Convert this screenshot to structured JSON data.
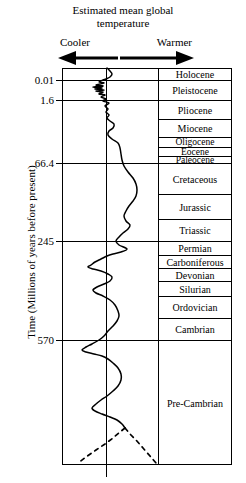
{
  "header": {
    "title_line1": "Estimated mean global",
    "title_line2": "temperature",
    "cooler_label": "Cooler",
    "warmer_label": "Warmer"
  },
  "axis": {
    "y_title": "Time (Millions of years before present)"
  },
  "chart_data": {
    "type": "line",
    "title": "Estimated mean global temperature",
    "xlabel": "Estimated mean global temperature",
    "ylabel": "Time (Millions of years before present)",
    "x_direction_left": "Cooler",
    "x_direction_right": "Warmer",
    "y_axis_inverted": true,
    "y_scale": "non-linear (geological stages)",
    "grid": true,
    "legend": "none",
    "y_tick_labels": [
      "0.01",
      "1.6",
      "66.4",
      "245",
      "570"
    ],
    "y_tick_values": [
      0.01,
      1.6,
      66.4,
      245,
      570
    ],
    "y_tick_pixels": [
      80,
      100,
      163,
      241,
      340
    ],
    "geologic_units": [
      {
        "name": "Holocene",
        "y_top": 68,
        "y_bottom": 80
      },
      {
        "name": "Pleistocene",
        "y_top": 80,
        "y_bottom": 100
      },
      {
        "name": "Pliocene",
        "y_top": 100,
        "y_bottom": 119
      },
      {
        "name": "Miocene",
        "y_top": 119,
        "y_bottom": 137
      },
      {
        "name": "Oligocene",
        "y_top": 137,
        "y_bottom": 147
      },
      {
        "name": "Eocene",
        "y_top": 147,
        "y_bottom": 156
      },
      {
        "name": "Paleocene",
        "y_top": 156,
        "y_bottom": 163
      },
      {
        "name": "Cretaceous",
        "y_top": 163,
        "y_bottom": 194
      },
      {
        "name": "Jurassic",
        "y_top": 194,
        "y_bottom": 219
      },
      {
        "name": "Triassic",
        "y_top": 219,
        "y_bottom": 241
      },
      {
        "name": "Permian",
        "y_top": 241,
        "y_bottom": 255
      },
      {
        "name": "Carboniferous",
        "y_top": 255,
        "y_bottom": 268
      },
      {
        "name": "Devonian",
        "y_top": 268,
        "y_bottom": 281
      },
      {
        "name": "Silurian",
        "y_top": 281,
        "y_bottom": 296
      },
      {
        "name": "Ordovician",
        "y_top": 296,
        "y_bottom": 318
      },
      {
        "name": "Cambrian",
        "y_top": 318,
        "y_bottom": 340
      },
      {
        "name": "Pre-Cambrian",
        "y_top": 340,
        "y_bottom": 465
      }
    ],
    "series": [
      {
        "name": "Estimated mean global temperature",
        "style": "solid",
        "note": "relative temperature anomaly; centre vertical line = reference, right = warmer, left = cooler",
        "points_px": [
          [
            107,
            68
          ],
          [
            110,
            71
          ],
          [
            112,
            74
          ],
          [
            110,
            77
          ],
          [
            106,
            79
          ],
          [
            103,
            80
          ],
          [
            99,
            82
          ],
          [
            104,
            83
          ],
          [
            96,
            85
          ],
          [
            103,
            86
          ],
          [
            93,
            87
          ],
          [
            102,
            88
          ],
          [
            95,
            89
          ],
          [
            104,
            90
          ],
          [
            96,
            91
          ],
          [
            103,
            92
          ],
          [
            99,
            94
          ],
          [
            105,
            95
          ],
          [
            101,
            97
          ],
          [
            106,
            99
          ],
          [
            103,
            101
          ],
          [
            109,
            103
          ],
          [
            105,
            106
          ],
          [
            108,
            109
          ],
          [
            106,
            112
          ],
          [
            109,
            115
          ],
          [
            107,
            118
          ],
          [
            110,
            121
          ],
          [
            114,
            124
          ],
          [
            113,
            128
          ],
          [
            109,
            131
          ],
          [
            108,
            135
          ],
          [
            112,
            139
          ],
          [
            118,
            143
          ],
          [
            120,
            148
          ],
          [
            121,
            154
          ],
          [
            122,
            160
          ],
          [
            124,
            166
          ],
          [
            128,
            172
          ],
          [
            133,
            178
          ],
          [
            136,
            184
          ],
          [
            137,
            190
          ],
          [
            136,
            196
          ],
          [
            133,
            201
          ],
          [
            129,
            206
          ],
          [
            126,
            211
          ],
          [
            124,
            216
          ],
          [
            126,
            221
          ],
          [
            130,
            225
          ],
          [
            128,
            229
          ],
          [
            123,
            233
          ],
          [
            119,
            237
          ],
          [
            116,
            241
          ],
          [
            119,
            245
          ],
          [
            127,
            249
          ],
          [
            121,
            252
          ],
          [
            113,
            254
          ],
          [
            107,
            256
          ],
          [
            101,
            259
          ],
          [
            95,
            262
          ],
          [
            91,
            265
          ],
          [
            88,
            267
          ],
          [
            93,
            269
          ],
          [
            101,
            271
          ],
          [
            108,
            274
          ],
          [
            112,
            277
          ],
          [
            110,
            281
          ],
          [
            104,
            284
          ],
          [
            97,
            287
          ],
          [
            93,
            290
          ],
          [
            96,
            293
          ],
          [
            103,
            296
          ],
          [
            110,
            300
          ],
          [
            115,
            305
          ],
          [
            118,
            311
          ],
          [
            119,
            316
          ],
          [
            117,
            321
          ],
          [
            113,
            326
          ],
          [
            108,
            331
          ],
          [
            104,
            336
          ],
          [
            99,
            340
          ],
          [
            92,
            344
          ],
          [
            86,
            347
          ],
          [
            82,
            350
          ],
          [
            86,
            352
          ],
          [
            94,
            354
          ],
          [
            102,
            356
          ],
          [
            108,
            359
          ],
          [
            113,
            363
          ],
          [
            118,
            368
          ],
          [
            121,
            374
          ],
          [
            121,
            380
          ],
          [
            118,
            386
          ],
          [
            113,
            391
          ],
          [
            107,
            396
          ],
          [
            101,
            400
          ],
          [
            96,
            404
          ],
          [
            92,
            408
          ],
          [
            95,
            411
          ],
          [
            102,
            414
          ],
          [
            110,
            417
          ],
          [
            117,
            420
          ],
          [
            122,
            424
          ],
          [
            125,
            428
          ]
        ]
      },
      {
        "name": "Inferred (uncertain) early record",
        "style": "dashed",
        "points_px": [
          [
            125,
            428
          ],
          [
            130,
            434
          ],
          [
            136,
            440
          ],
          [
            143,
            448
          ],
          [
            150,
            456
          ],
          [
            156,
            463
          ]
        ],
        "points_px_left": [
          [
            125,
            428
          ],
          [
            120,
            432
          ],
          [
            113,
            438
          ],
          [
            105,
            444
          ],
          [
            96,
            450
          ],
          [
            86,
            457
          ],
          [
            78,
            463
          ]
        ]
      }
    ]
  }
}
